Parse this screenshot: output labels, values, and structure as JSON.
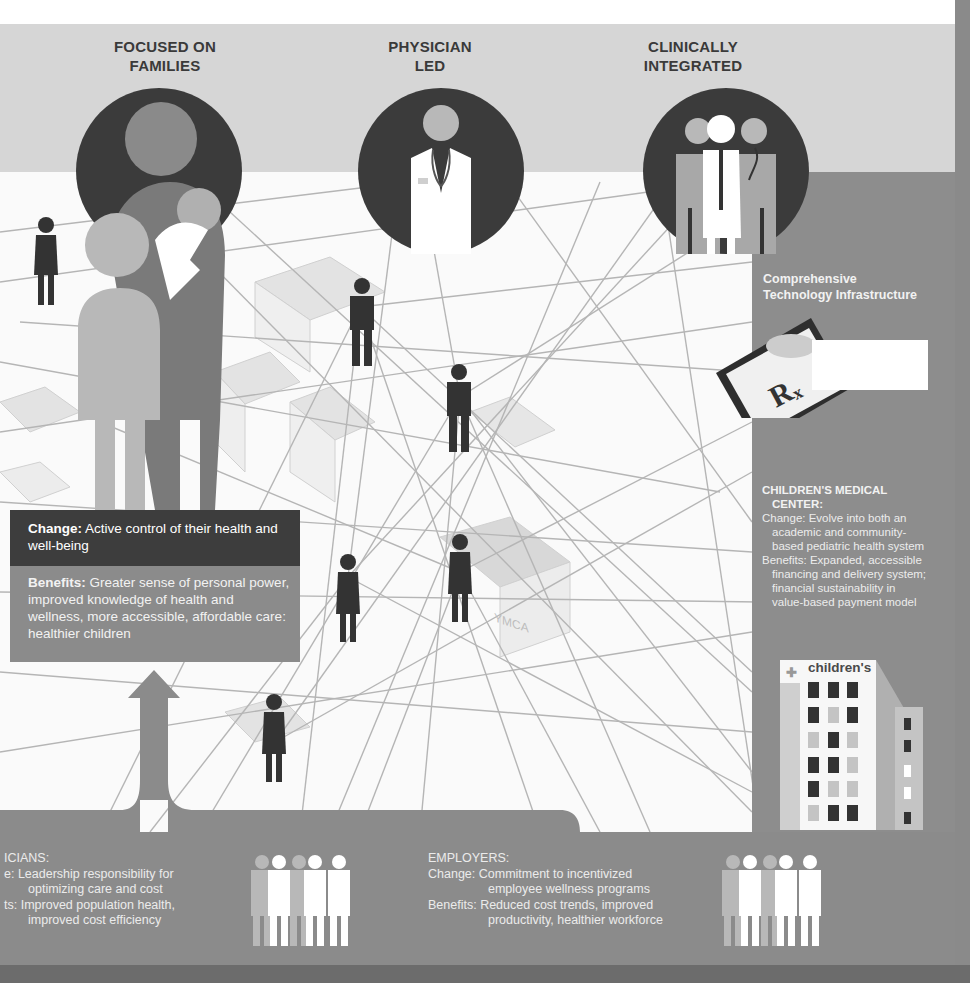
{
  "headers": {
    "families": [
      "FOCUSED ON",
      "FAMILIES"
    ],
    "physician": [
      "PHYSICIAN",
      "LED"
    ],
    "clinical": [
      "CLINICALLY",
      "INTEGRATED"
    ]
  },
  "technology": {
    "title_line1": "Comprehensive",
    "title_line2": "Technology Infrastructure",
    "tablet_symbol": "R",
    "tablet_subscript": "x"
  },
  "medical_center": {
    "title_line1": "CHILDREN'S MEDICAL",
    "title_line2": "CENTER:",
    "change_lines": [
      "Change: Evolve into both an",
      "academic and community-",
      "based pediatric health system"
    ],
    "benefits_lines": [
      "Benefits: Expanded, accessible",
      "financing and delivery system;",
      "financial sustainability in",
      "value-based payment model"
    ],
    "building_sign": "children's"
  },
  "families_box": {
    "change_label": "Change:",
    "change_text": " Active control of their health and well-being",
    "benefits_label": "Benefits:",
    "benefits_text": " Greater sense of personal power, improved knowledge of health and wellness, more accessible, affordable care: healthier children"
  },
  "physicians": {
    "title": "ICIANS:",
    "change_label": "e:",
    "change_lines": [
      "Leadership responsibility for",
      "optimizing care and cost"
    ],
    "benefits_label": "ts:",
    "benefits_lines": [
      "Improved population health,",
      "improved cost efficiency"
    ]
  },
  "employers": {
    "title": "EMPLOYERS:",
    "change_label": "Change:",
    "change_lines": [
      "Commitment to incentivized",
      "employee wellness programs"
    ],
    "benefits_label": "Benefits:",
    "benefits_lines": [
      "Reduced cost trends, improved",
      "productivity, healthier workforce"
    ]
  },
  "network_labels": {
    "ymca": "YMCA"
  },
  "colors": {
    "banner": "#d6d6d6",
    "panel": "#8d8d8d",
    "dark": "#3b3b3b",
    "mid": "#8b8b8b",
    "light": "#c4c4c4"
  }
}
